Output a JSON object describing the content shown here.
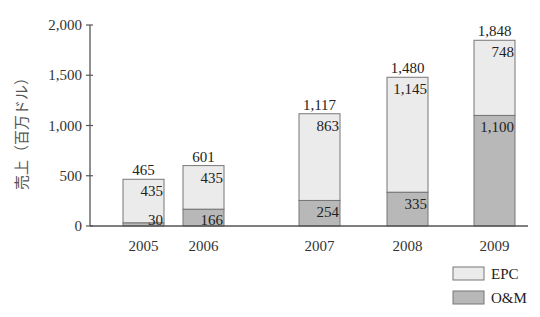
{
  "chart_data": {
    "type": "bar",
    "stacked": true,
    "title": "",
    "xlabel": "",
    "ylabel": "売上（百万ドル）",
    "categories": [
      "2005",
      "2006",
      "2007",
      "2008",
      "2009"
    ],
    "series": [
      {
        "name": "O&M",
        "values": [
          30,
          166,
          254,
          335,
          1100
        ],
        "color": "#b8b8b8"
      },
      {
        "name": "EPC",
        "values": [
          435,
          435,
          863,
          1145,
          748
        ],
        "color": "#ebebeb"
      }
    ],
    "totals": [
      465,
      601,
      1117,
      1480,
      1848
    ],
    "total_labels": [
      "465",
      "601",
      "1,117",
      "1,480",
      "1,848"
    ],
    "segment_labels": {
      "O&M": [
        "30",
        "166",
        "254",
        "335",
        "1,100"
      ],
      "EPC": [
        "435",
        "435",
        "863",
        "1,145",
        "748"
      ]
    },
    "ylim": [
      0,
      2000
    ],
    "yticks": [
      0,
      500,
      1000,
      1500,
      2000
    ],
    "ytick_labels": [
      "0",
      "500",
      "1,000",
      "1,500",
      "2,000"
    ],
    "grid": false,
    "legend": {
      "position": "bottom-right",
      "entries": [
        "EPC",
        "O&M"
      ]
    }
  },
  "legend": {
    "epc": "EPC",
    "om": "O&M"
  },
  "axis": {
    "ylabel": "売上（百万ドル）"
  }
}
